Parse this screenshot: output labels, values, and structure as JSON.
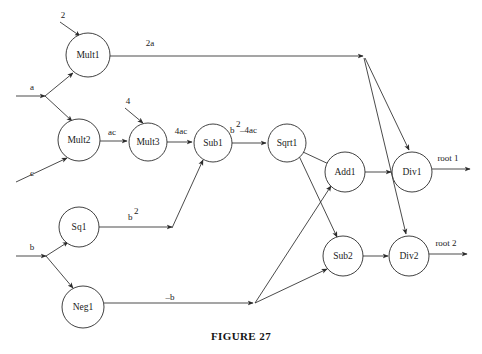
{
  "figure": {
    "caption": "FIGURE 27"
  },
  "diagram": {
    "type": "dataflow-graph",
    "nodes": [
      {
        "id": "mult1",
        "label": "Mult1",
        "cx": 88,
        "cy": 55,
        "r": 22
      },
      {
        "id": "mult2",
        "label": "Mult2",
        "cx": 79,
        "cy": 140,
        "r": 21
      },
      {
        "id": "mult3",
        "label": "Mult3",
        "cx": 148,
        "cy": 142,
        "r": 19
      },
      {
        "id": "sub1",
        "label": "Sub1",
        "cx": 213,
        "cy": 143,
        "r": 19
      },
      {
        "id": "sqrt1",
        "label": "Sqrt1",
        "cx": 287,
        "cy": 143,
        "r": 19
      },
      {
        "id": "add1",
        "label": "Add1",
        "cx": 345,
        "cy": 172,
        "r": 20
      },
      {
        "id": "div1",
        "label": "Div1",
        "cx": 412,
        "cy": 172,
        "r": 20
      },
      {
        "id": "sq1",
        "label": "Sq1",
        "cx": 79,
        "cy": 227,
        "r": 20
      },
      {
        "id": "neg1",
        "label": "Neg1",
        "cx": 83,
        "cy": 307,
        "r": 21
      },
      {
        "id": "sub2",
        "label": "Sub2",
        "cx": 343,
        "cy": 256,
        "r": 20
      },
      {
        "id": "div2",
        "label": "Div2",
        "cx": 409,
        "cy": 256,
        "r": 20
      }
    ],
    "inputs": [
      {
        "id": "const2",
        "label": "2",
        "x": 63,
        "y": 18
      },
      {
        "id": "in_a",
        "label": "a",
        "x": 32,
        "y": 90
      },
      {
        "id": "const4",
        "label": "4",
        "x": 128,
        "y": 104
      },
      {
        "id": "in_c",
        "label": "c",
        "x": 32,
        "y": 176
      },
      {
        "id": "in_b",
        "label": "b",
        "x": 32,
        "y": 250
      }
    ],
    "edge_labels": [
      {
        "id": "lbl_2a",
        "text": "2a",
        "x": 150,
        "y": 46
      },
      {
        "id": "lbl_ac",
        "text": "ac",
        "x": 112,
        "y": 135
      },
      {
        "id": "lbl_4ac",
        "text": "4ac",
        "x": 181,
        "y": 134
      },
      {
        "id": "lbl_disc",
        "base": "b",
        "sup": "2",
        "tail": "–4ac",
        "x": 234,
        "y": 130
      },
      {
        "id": "lbl_bsq",
        "base": "b",
        "sup": "2",
        "x": 130,
        "y": 217
      },
      {
        "id": "lbl_negb",
        "text": "–b",
        "x": 170,
        "y": 297
      }
    ],
    "outputs": [
      {
        "id": "root1",
        "label": "root 1",
        "x": 432,
        "y": 158
      },
      {
        "id": "root2",
        "label": "root 2",
        "x": 430,
        "y": 243
      }
    ],
    "colors": {
      "stroke": "#2b2b2b",
      "text": "#1a1a1a",
      "background": "#ffffff"
    }
  }
}
